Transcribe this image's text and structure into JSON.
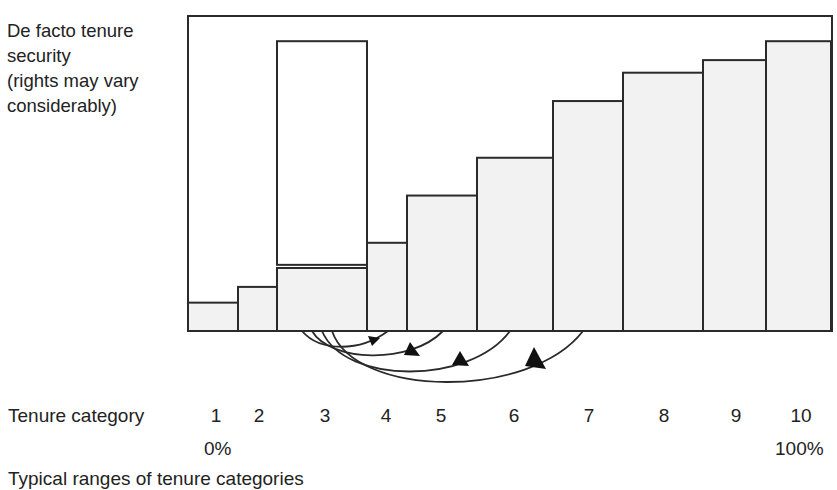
{
  "chart_data": {
    "type": "bar",
    "title": "",
    "ylabel": "De facto tenure security\n(rights may vary considerably)",
    "xlabel": "Tenure category",
    "categories": [
      "1",
      "2",
      "3",
      "4",
      "5",
      "6",
      "7",
      "8",
      "9",
      "10"
    ],
    "values": [
      9,
      14,
      20,
      28,
      43,
      55,
      73,
      82,
      86,
      92
    ],
    "bar_widths_px": [
      50,
      39,
      90,
      40,
      70,
      76,
      70,
      80,
      63,
      65
    ],
    "range_box": {
      "category": "3",
      "low": 21,
      "high": 92,
      "note": "unshaded box showing possible range of rights for category 3"
    },
    "arrows": [
      {
        "from": "3",
        "to": "4"
      },
      {
        "from": "3",
        "to": "5"
      },
      {
        "from": "3",
        "to": "6"
      },
      {
        "from": "3",
        "to": "7"
      }
    ],
    "ylim": [
      0,
      100
    ],
    "grid": false,
    "x_endpoints": {
      "left": "0%",
      "right": "100%"
    },
    "caption": "Typical ranges of tenure categories"
  },
  "labels": {
    "ylabel": "De facto tenure\nsecurity\n(rights may vary\nconsiderably)",
    "xtitle": "Tenure category",
    "ticks": [
      "1",
      "2",
      "3",
      "4",
      "5",
      "6",
      "7",
      "8",
      "9",
      "10"
    ],
    "pct_left": "0%",
    "pct_right": "100%",
    "caption": "Typical ranges of tenure categories"
  },
  "colors": {
    "bar_fill": "#f2f2f2",
    "stroke": "#2a2a2a",
    "text": "#222222"
  }
}
